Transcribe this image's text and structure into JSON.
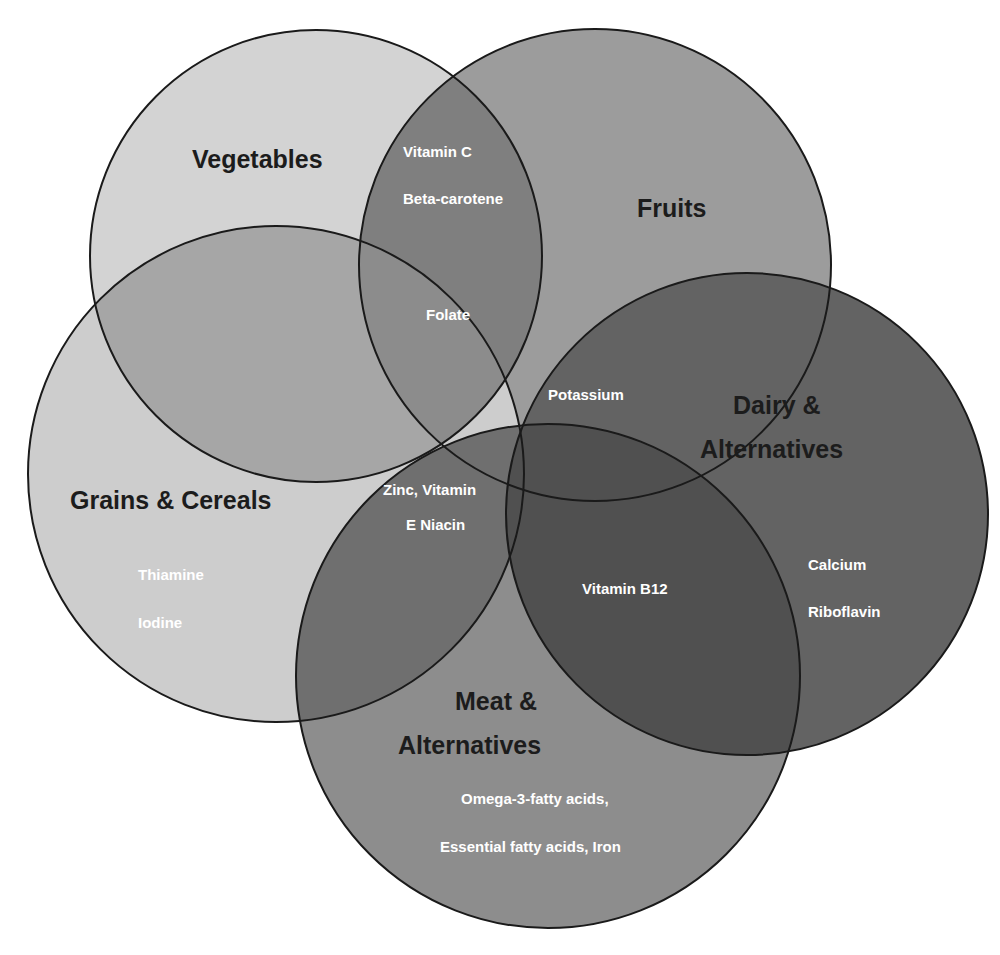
{
  "header": {
    "text": "7.6   Oral Grenade"
  },
  "diagram": {
    "type": "venn",
    "title": "",
    "sets": [
      {
        "id": "vegetables",
        "label": "Vegetables",
        "fill": "#d3d3d3"
      },
      {
        "id": "fruits",
        "label": "Fruits",
        "fill": "#9c9c9c"
      },
      {
        "id": "grains",
        "label": "Grains & Cereals",
        "fill": "#cdcdcd"
      },
      {
        "id": "dairy",
        "label_line1": "Dairy &",
        "label_line2": "Alternatives",
        "fill": "#636363"
      },
      {
        "id": "meat",
        "label_line1": "Meat &",
        "label_line2": "Alternatives",
        "fill": "#8d8d8d"
      }
    ],
    "nutrients": {
      "vitamin_c": "Vitamin C",
      "beta_carotene": "Beta-carotene",
      "folate": "Folate",
      "potassium": "Potassium",
      "zinc_line1": "Zinc, Vitamin",
      "zinc_line2": "E Niacin",
      "vitamin_b12": "Vitamin B12",
      "calcium": "Calcium",
      "riboflavin": "Riboflavin",
      "thiamine": "Thiamine",
      "iodine": "Iodine",
      "omega3": "Omega-3-fatty acids,",
      "essential": "Essential fatty acids, Iron"
    },
    "overlap_fill": {
      "veg_fruits": "#7f7f7f",
      "veg_grains": "#a6a6a6",
      "grains_meat": "#6f6f6f",
      "dairy_meat": "#505050"
    }
  }
}
